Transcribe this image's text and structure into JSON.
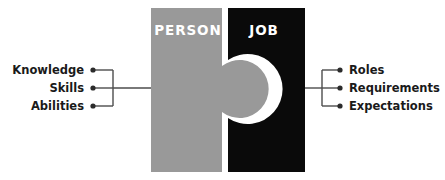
{
  "diagram": {
    "title_person": "PERSON",
    "title_job": "JOB",
    "colors": {
      "person_fill": "#999999",
      "job_fill": "#0a0a0a",
      "background": "#ffffff",
      "label_text": "#ffffff",
      "side_text": "#1a1a1a",
      "leader_line": "#4d4d4d",
      "bullet": "#2b2b2b"
    },
    "left_group": {
      "items": [
        {
          "label": "Knowledge"
        },
        {
          "label": "Skills"
        },
        {
          "label": "Abilities"
        }
      ]
    },
    "right_group": {
      "items": [
        {
          "label": "Roles"
        },
        {
          "label": "Requirements"
        },
        {
          "label": "Expectations"
        }
      ]
    }
  }
}
